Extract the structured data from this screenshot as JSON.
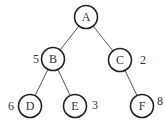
{
  "diagram": {
    "type": "binary-tree",
    "nodes": [
      {
        "id": "A",
        "label": "A",
        "x": 86,
        "y": 17,
        "weight": null
      },
      {
        "id": "B",
        "label": "B",
        "x": 53,
        "y": 59,
        "weight": "5",
        "wx": 36,
        "wy": 59
      },
      {
        "id": "C",
        "label": "C",
        "x": 120,
        "y": 60,
        "weight": "2",
        "wx": 143,
        "wy": 60
      },
      {
        "id": "D",
        "label": "D",
        "x": 30,
        "y": 106,
        "weight": "6",
        "wx": 11,
        "wy": 106
      },
      {
        "id": "E",
        "label": "E",
        "x": 75,
        "y": 106,
        "weight": "3",
        "wx": 95,
        "wy": 105
      },
      {
        "id": "F",
        "label": "F",
        "x": 142,
        "y": 106,
        "weight": "8",
        "wx": 160,
        "wy": 101
      }
    ],
    "edges": [
      [
        "A",
        "B"
      ],
      [
        "A",
        "C"
      ],
      [
        "B",
        "D"
      ],
      [
        "B",
        "E"
      ],
      [
        "C",
        "F"
      ]
    ]
  }
}
